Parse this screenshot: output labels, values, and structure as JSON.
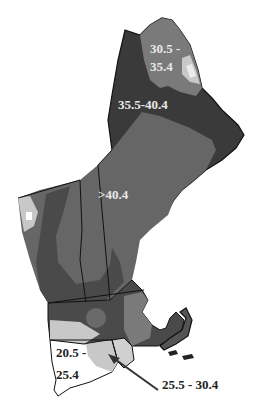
{
  "map": {
    "region": "New England",
    "classes": [
      {
        "label": "20.5 - 25.4",
        "fill": "#ffffff"
      },
      {
        "label": "25.5 - 30.4",
        "fill": "#c8c8c8"
      },
      {
        "label": "30.5 - 35.4",
        "fill": "#737373"
      },
      {
        "label": "35.5-40.4",
        "fill": "#3a3a3a"
      },
      {
        "label": ">40.4",
        "fill": "#666666"
      }
    ],
    "labels": {
      "north_maine_line1": "30.5 -",
      "north_maine_line2": "35.4",
      "central_maine": "35.5-40.4",
      "interior": ">40.4",
      "connecticut_line1": "20.5 -",
      "connecticut_line2": "25.4",
      "callout": "25.5 - 30.4"
    }
  }
}
